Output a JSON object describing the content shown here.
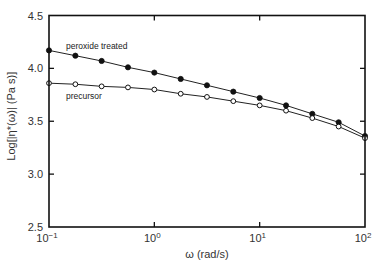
{
  "chart_data": {
    "type": "line",
    "title": "",
    "xlabel": "ω (rad/s)",
    "ylabel": "Log[|η*(ω)| (Pa s)]",
    "xscale": "log",
    "xlim": [
      0.1,
      100
    ],
    "ylim": [
      2.5,
      4.5
    ],
    "grid": false,
    "x_ticks": [
      {
        "value": 0.1,
        "base": "10",
        "exp": "−1"
      },
      {
        "value": 1,
        "base": "10",
        "exp": "0"
      },
      {
        "value": 10,
        "base": "10",
        "exp": "1"
      },
      {
        "value": 100,
        "base": "10",
        "exp": "2"
      }
    ],
    "y_ticks": [
      {
        "value": 2.5,
        "label": "2.5"
      },
      {
        "value": 3.0,
        "label": "3.0"
      },
      {
        "value": 3.5,
        "label": "3.5"
      },
      {
        "value": 4.0,
        "label": "4.0"
      },
      {
        "value": 4.5,
        "label": "4.5"
      }
    ],
    "x": [
      0.1,
      0.178,
      0.316,
      0.562,
      1.0,
      1.78,
      3.16,
      5.62,
      10.0,
      17.8,
      31.6,
      56.2,
      100.0
    ],
    "series": [
      {
        "name": "peroxide treated",
        "marker": "filled-circle",
        "values": [
          4.17,
          4.12,
          4.07,
          4.01,
          3.96,
          3.9,
          3.84,
          3.78,
          3.72,
          3.65,
          3.57,
          3.49,
          3.36
        ]
      },
      {
        "name": "precursor",
        "marker": "open-circle",
        "values": [
          3.86,
          3.85,
          3.83,
          3.82,
          3.8,
          3.76,
          3.73,
          3.69,
          3.65,
          3.6,
          3.53,
          3.45,
          3.34
        ]
      }
    ],
    "annotations": [
      {
        "text": "peroxide treated",
        "series": 0
      },
      {
        "text": "precursor",
        "series": 1
      }
    ],
    "legend": "inline-labels"
  }
}
